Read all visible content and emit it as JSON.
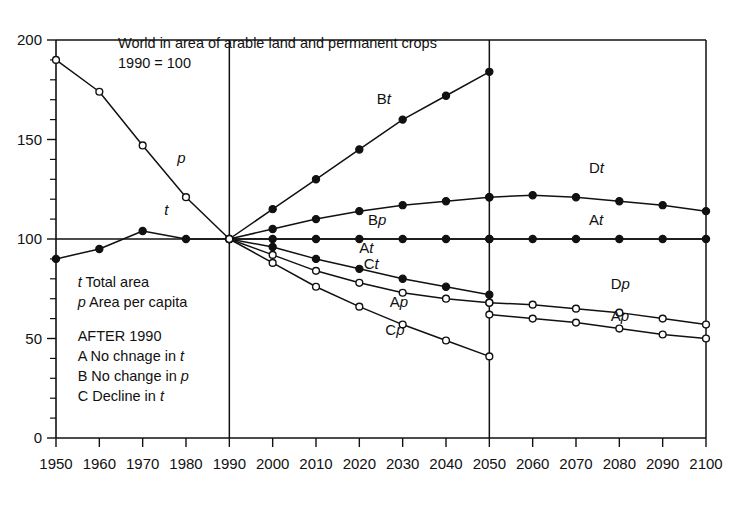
{
  "chart_data": {
    "type": "line",
    "title": "World in area of arable land and permanent crops",
    "subtitle": "1990 = 100",
    "xlabel": "",
    "ylabel": "",
    "xlim": [
      1950,
      2100
    ],
    "ylim": [
      0,
      200
    ],
    "grid": false,
    "legend_position": "inside-lower-left",
    "x_ticks": [
      "1950",
      "1960",
      "1970",
      "1980",
      "1990",
      "2000",
      "2010",
      "2020",
      "2030",
      "2040",
      "2050",
      "2060",
      "2070",
      "2080",
      "2090",
      "2100"
    ],
    "y_ticks": [
      "0",
      "50",
      "100",
      "150",
      "200"
    ],
    "y_minor_step": 10,
    "reference_lines": [
      1990,
      2050
    ],
    "series": [
      {
        "name": "p",
        "label": "p",
        "marker": "open",
        "x": [
          1950,
          1960,
          1970,
          1980,
          1990
        ],
        "values": [
          190,
          174,
          147,
          121,
          100
        ]
      },
      {
        "name": "t",
        "label": "t",
        "marker": "filled",
        "x": [
          1950,
          1960,
          1970,
          1980,
          1990
        ],
        "values": [
          90,
          95,
          104,
          100,
          100
        ]
      },
      {
        "name": "Bt",
        "label": "Bt",
        "marker": "filled",
        "x": [
          1990,
          2000,
          2010,
          2020,
          2030,
          2040,
          2050
        ],
        "values": [
          100,
          115,
          130,
          145,
          160,
          172,
          184
        ]
      },
      {
        "name": "Bp",
        "label": "Bp",
        "marker": "filled",
        "x": [
          1990,
          2000,
          2010,
          2020,
          2030,
          2040,
          2050
        ],
        "values": [
          100,
          105,
          110,
          114,
          117,
          119,
          121
        ]
      },
      {
        "name": "At-left",
        "label": "At",
        "marker": "filled",
        "x": [
          1990,
          2000,
          2010,
          2020,
          2030,
          2040,
          2050
        ],
        "values": [
          100,
          100,
          100,
          100,
          100,
          100,
          100
        ]
      },
      {
        "name": "Ct",
        "label": "Ct",
        "marker": "filled",
        "x": [
          1990,
          2000,
          2010,
          2020,
          2030,
          2040,
          2050
        ],
        "values": [
          100,
          96,
          90,
          85,
          80,
          76,
          72
        ]
      },
      {
        "name": "Ap-left",
        "label": "Ap",
        "marker": "open",
        "x": [
          1990,
          2000,
          2010,
          2020,
          2030,
          2040,
          2050
        ],
        "values": [
          100,
          92,
          84,
          78,
          73,
          70,
          68
        ]
      },
      {
        "name": "Cp-left",
        "label": "Cp",
        "marker": "open",
        "x": [
          1990,
          2000,
          2010,
          2020,
          2030,
          2040,
          2050
        ],
        "values": [
          100,
          88,
          76,
          66,
          57,
          49,
          41
        ]
      },
      {
        "name": "Dt",
        "label": "Dt",
        "marker": "filled",
        "x": [
          2050,
          2060,
          2070,
          2080,
          2090,
          2100
        ],
        "values": [
          121,
          122,
          121,
          119,
          117,
          114
        ]
      },
      {
        "name": "At-right",
        "label": "At",
        "marker": "filled",
        "x": [
          2050,
          2060,
          2070,
          2080,
          2090,
          2100
        ],
        "values": [
          100,
          100,
          100,
          100,
          100,
          100
        ]
      },
      {
        "name": "Dp",
        "label": "Dp",
        "marker": "open",
        "x": [
          2050,
          2060,
          2070,
          2080,
          2090,
          2100
        ],
        "values": [
          68,
          67,
          65,
          63,
          60,
          57
        ]
      },
      {
        "name": "Ap-right",
        "label": "Ap",
        "marker": "open",
        "x": [
          2050,
          2060,
          2070,
          2080,
          2090,
          2100
        ],
        "values": [
          62,
          60,
          58,
          55,
          52,
          50
        ]
      }
    ],
    "annotations": [
      {
        "name": "p",
        "text_plain": "",
        "text_italic": "p",
        "x": 1978,
        "y": 138
      },
      {
        "name": "t",
        "text_plain": "",
        "text_italic": "t",
        "x": 1975,
        "y": 112
      },
      {
        "name": "Bt",
        "text_plain": "B",
        "text_italic": "t",
        "x": 2024,
        "y": 168
      },
      {
        "name": "Bp",
        "text_plain": "B",
        "text_italic": "p",
        "x": 2022,
        "y": 107
      },
      {
        "name": "At",
        "text_plain": "A",
        "text_italic": "t",
        "x": 2020,
        "y": 93
      },
      {
        "name": "Ct",
        "text_plain": "C",
        "text_italic": "t",
        "x": 2021,
        "y": 85
      },
      {
        "name": "Ap",
        "text_plain": "A",
        "text_italic": "p",
        "x": 2027,
        "y": 66
      },
      {
        "name": "Cp",
        "text_plain": "C",
        "text_italic": "p",
        "x": 2026,
        "y": 52
      },
      {
        "name": "Dt",
        "text_plain": "D",
        "text_italic": "t",
        "x": 2073,
        "y": 133
      },
      {
        "name": "At-right",
        "text_plain": "A",
        "text_italic": "t",
        "x": 2073,
        "y": 107
      },
      {
        "name": "Dp",
        "text_plain": "D",
        "text_italic": "p",
        "x": 2078,
        "y": 75
      },
      {
        "name": "Ap-right",
        "text_plain": "A",
        "text_italic": "p",
        "x": 2078,
        "y": 59
      }
    ]
  },
  "legend": {
    "rows": [
      {
        "key_italic": "t",
        "text": " Total area"
      },
      {
        "key_italic": "p",
        "text": " Area per capita"
      }
    ],
    "heading": "AFTER 1990",
    "items": [
      {
        "prefix": "A",
        "text": " No chnage in ",
        "suffix_italic": "t"
      },
      {
        "prefix": "B",
        "text": " No change in ",
        "suffix_italic": "p"
      },
      {
        "prefix": "C",
        "text": " Decline in ",
        "suffix_italic": "t"
      }
    ]
  },
  "colors": {
    "ink": "#111111",
    "background": "#ffffff"
  }
}
